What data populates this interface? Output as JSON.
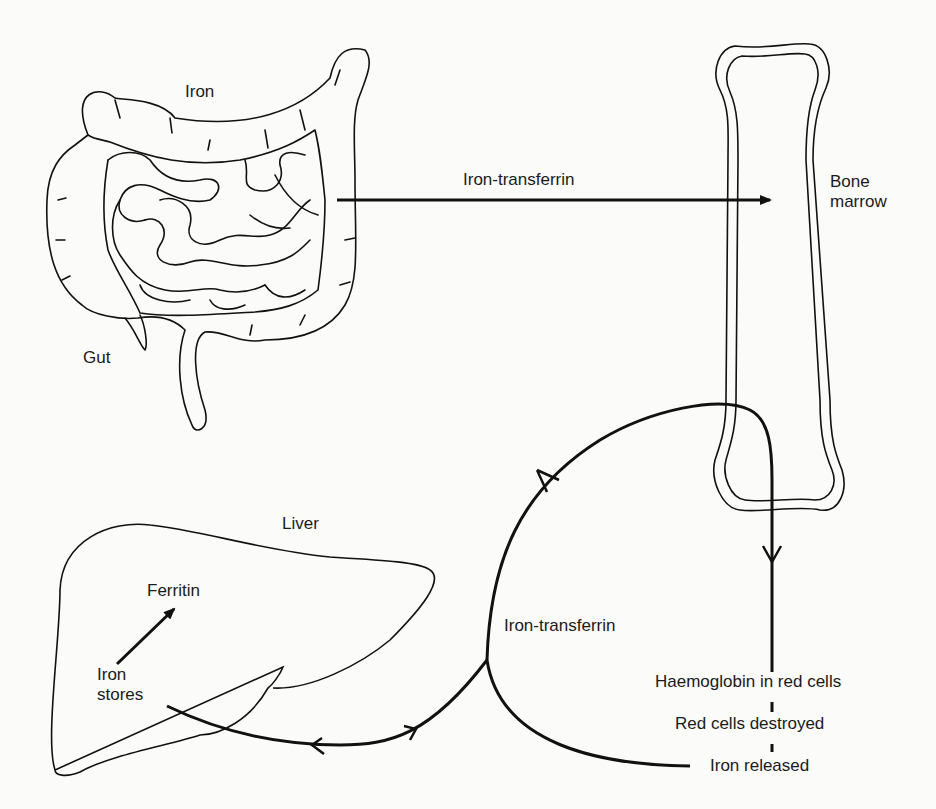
{
  "diagram": {
    "type": "iron-metabolism-cycle",
    "organs": {
      "gut": {
        "label": "Gut",
        "top_label": "Iron"
      },
      "bone": {
        "label": "Bone\nmarrow"
      },
      "liver": {
        "label": "Liver",
        "stores_label": "Iron\nstores",
        "ferritin_label": "Ferritin"
      }
    },
    "flows": {
      "gut_to_bone": "Iron-transferrin",
      "liver_bone_loop": "Iron-transferrin",
      "haemoglobin": "Haemoglobin in red cells",
      "destroyed": "Red cells destroyed",
      "released": "Iron released"
    },
    "colors": {
      "line": "#111111",
      "background": "#fbfbfa"
    }
  }
}
